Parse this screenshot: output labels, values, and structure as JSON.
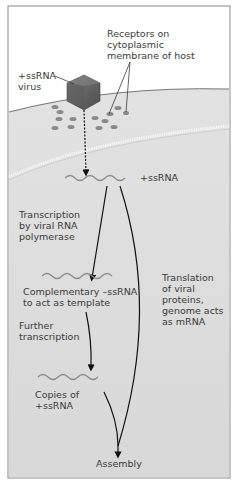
{
  "diagram": {
    "labels": {
      "receptors": "Receptors on\ncytoplasmic\nmembrane of host",
      "virus": "+ssRNA\nvirus",
      "ssrna_entry": "+ssRNA",
      "transcription": "Transcription\nby viral RNA\npolymerase",
      "complementary": "Complementary –ssRNA\nto act as template",
      "further": "Further\ntranscription",
      "copies": "Copies of\n+ssRNA",
      "translation": "Translation\nof viral\nproteins,\ngenome acts\nas mRNA",
      "assembly": "Assembly"
    },
    "colors": {
      "border": "#8a8a8a",
      "membrane": "#d4d4d4",
      "cytoplasm": "#dcdcdc",
      "rna": "#8c8c8c",
      "virus": "#6a6a6a",
      "receptor": "#8a8a8a",
      "arrow": "#111111"
    }
  }
}
